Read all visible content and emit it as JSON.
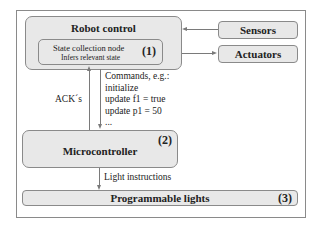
{
  "robot_control": {
    "title": "Robot control",
    "state_node": {
      "title": "State collection node",
      "subtitle": "Infers relevant state",
      "number": "(1)"
    }
  },
  "sensors": {
    "title": "Sensors"
  },
  "actuators": {
    "title": "Actuators"
  },
  "edges": {
    "acks": "ACK´s",
    "commands": "Commands, e.g.:\ninitialize\nupdate f1 = true\nupdate p1 = 50\n...",
    "light_instructions": "Light instructions"
  },
  "microcontroller": {
    "title": "Microcontroller",
    "number": "(2)"
  },
  "programmable_lights": {
    "title": "Programmable lights",
    "number": "(3)"
  },
  "colors": {
    "box_fill": "#e8e8e8",
    "border": "#8a8a8a",
    "arrow": "#7a7a7a"
  }
}
